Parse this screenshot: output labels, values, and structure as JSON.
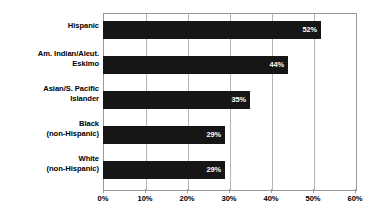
{
  "chart_data": {
    "type": "bar",
    "orientation": "horizontal",
    "title": "",
    "subtitle": "",
    "xlabel": "",
    "ylabel": "",
    "categories": [
      "Hispanic",
      "Am. Indian/Aleut. Eskimo",
      "Asian/S. Pacific Islander",
      "Black (non-Hispanic)",
      "White (non-Hispanic)"
    ],
    "values": [
      52,
      44,
      35,
      29,
      29
    ],
    "data_labels": [
      "52%",
      "44%",
      "35%",
      "29%",
      "29%"
    ],
    "xlim": [
      0,
      60
    ],
    "xtick_values": [
      0,
      10,
      20,
      30,
      40,
      50,
      60
    ],
    "xtick_labels": [
      "0%",
      "10%",
      "20%",
      "30%",
      "40%",
      "50%",
      "60%"
    ],
    "grid": true,
    "grid_axis": "x",
    "legend": false,
    "legend_position": "none",
    "bar_color": "#161616",
    "grid_color": "#b4b4b4",
    "axis_color": "#9a9a9a",
    "data_label_color": "#ffffff",
    "plot_background": "#ffffff",
    "bars": [
      {
        "category_lines": [
          "Hispanic"
        ],
        "value": 52,
        "label": "52%"
      },
      {
        "category_lines": [
          "Am. Indian/Aleut.",
          "Eskimo"
        ],
        "value": 44,
        "label": "44%"
      },
      {
        "category_lines": [
          "Asian/S. Pacific",
          "Islander"
        ],
        "value": 35,
        "label": "35%"
      },
      {
        "category_lines": [
          "Black",
          "(non-Hispanic)"
        ],
        "value": 29,
        "label": "29%"
      },
      {
        "category_lines": [
          "White",
          "(non-Hispanic)"
        ],
        "value": 29,
        "label": "29%"
      }
    ]
  }
}
